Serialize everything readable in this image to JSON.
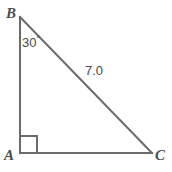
{
  "figure": {
    "type": "right-triangle-diagram",
    "background_color": "#ffffff",
    "stroke_color": "#6b6b6b",
    "text_color": "#4a4a4a",
    "vertices": {
      "a": {
        "label": "A",
        "x": 20,
        "y": 153
      },
      "b": {
        "label": "B",
        "x": 20,
        "y": 17
      },
      "c": {
        "label": "C",
        "x": 152,
        "y": 153
      }
    },
    "right_angle": {
      "at_vertex": "A",
      "marker": "square",
      "size": 17
    },
    "angles": [
      {
        "at_vertex": "B",
        "value": "30",
        "unit": "°",
        "text": "30°"
      }
    ],
    "sides": [
      {
        "name": "BC",
        "type": "hypotenuse",
        "length_label": "7.0"
      }
    ]
  },
  "chart_data": {
    "type": "diagram",
    "title": "",
    "shape": "right triangle",
    "labels": {
      "vertex_a": "A",
      "vertex_b": "B",
      "vertex_c": "C",
      "angle_b": "30°",
      "side_bc": "7.0"
    }
  }
}
